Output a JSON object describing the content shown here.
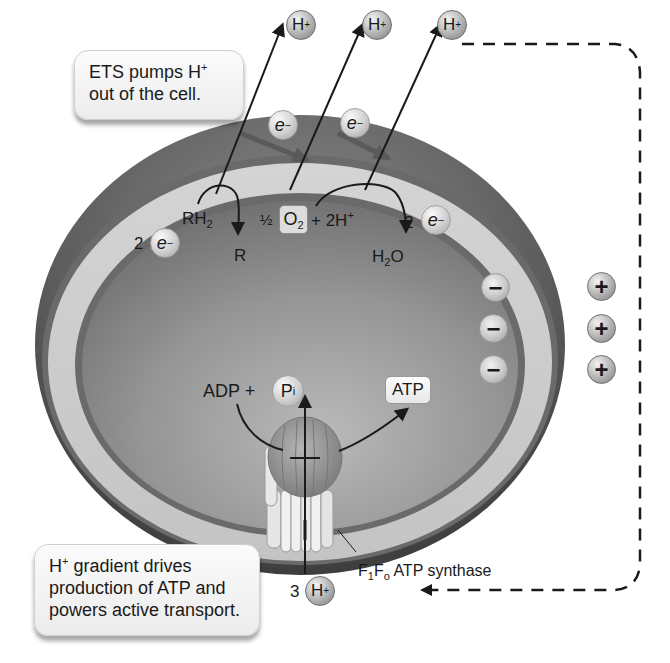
{
  "figure": {
    "callouts": {
      "top": {
        "line1_pre": "ETS pumps H",
        "line1_sup": "+",
        "line2": "out of the cell."
      },
      "bottom": {
        "line1_pre": "H",
        "line1_sup": "+",
        "line1_post": " gradient drives",
        "line2": "production of ATP and",
        "line3": "powers active transport."
      }
    },
    "protons_out": [
      {
        "label": "H",
        "charge": "+"
      },
      {
        "label": "H",
        "charge": "+"
      },
      {
        "label": "H",
        "charge": "+"
      }
    ],
    "electrons_in_membrane": [
      {
        "label": "e",
        "charge": "−"
      },
      {
        "label": "e",
        "charge": "−"
      }
    ],
    "reactions": {
      "donor": {
        "reactant": "RH",
        "reactant_sub": "2",
        "product": "R",
        "electrons_coef": "2",
        "electron_label": "e",
        "electron_charge": "−"
      },
      "acceptor": {
        "coef": "½",
        "o2": "O",
        "o2_sub": "2",
        "plus_protons": "+ 2H",
        "plus_sup": "+",
        "product_h": "H",
        "product_sub": "2",
        "product_o": "O",
        "electrons_coef": "2",
        "electron_label": "e",
        "electron_charge": "−"
      }
    },
    "inside_charges": [
      "−",
      "−",
      "−"
    ],
    "outside_charges": [
      "+",
      "+",
      "+"
    ],
    "atp_synthesis": {
      "adp": "ADP +",
      "pi": "P",
      "pi_sub": "i",
      "atp": "ATP"
    },
    "enzyme_label": {
      "f1": "F",
      "f1_sub": "1",
      "fo": "F",
      "fo_sub": "o",
      "rest": " ATP synthase"
    },
    "protons_in": {
      "coef": "3",
      "label": "H",
      "charge": "+"
    },
    "colors": {
      "outer_layer": "#5e5e5e",
      "periplasm": "#c8c8c8",
      "membrane_line": "#6a6a6a",
      "cytoplasm": "#8f8f8f",
      "synthase_head": "#9a9a9a",
      "arrow": "#1a1a1a",
      "dashed_path": "#1a1a1a"
    }
  }
}
